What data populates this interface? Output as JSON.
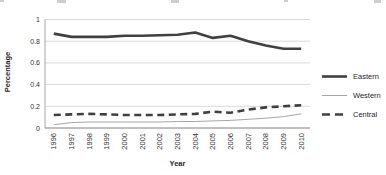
{
  "chart_data": {
    "type": "line",
    "title": "",
    "xlabel": "Year",
    "ylabel": "Percentage",
    "ylim": [
      0,
      1
    ],
    "yticks": [
      0,
      0.2,
      0.4,
      0.6,
      0.8,
      1
    ],
    "ytick_labels": [
      "0",
      "0.2",
      "0.4",
      "0.6",
      "0.8",
      "1"
    ],
    "grid": true,
    "legend_position": "right",
    "categories": [
      "1996",
      "1997",
      "1998",
      "1999",
      "2000",
      "2001",
      "2002",
      "2003",
      "2004",
      "2005",
      "2006",
      "2007",
      "2008",
      "2009",
      "2010"
    ],
    "series": [
      {
        "name": "Eastern",
        "color": "#404040",
        "width": 2.6,
        "dash": "",
        "values": [
          0.87,
          0.84,
          0.84,
          0.84,
          0.85,
          0.85,
          0.855,
          0.86,
          0.88,
          0.83,
          0.85,
          0.8,
          0.76,
          0.73,
          0.73
        ]
      },
      {
        "name": "Western",
        "color": "#a6a6a6",
        "width": 1,
        "dash": "",
        "values": [
          0.03,
          0.05,
          0.055,
          0.055,
          0.055,
          0.055,
          0.055,
          0.06,
          0.06,
          0.065,
          0.07,
          0.08,
          0.09,
          0.105,
          0.13
        ]
      },
      {
        "name": "Central",
        "color": "#404040",
        "width": 2.6,
        "dash": "7 4.5",
        "values": [
          0.12,
          0.125,
          0.13,
          0.125,
          0.12,
          0.12,
          0.12,
          0.125,
          0.13,
          0.15,
          0.14,
          0.17,
          0.19,
          0.2,
          0.21
        ]
      }
    ],
    "colors": {
      "gridline": "#d9d9d9",
      "y_axis_line": "#a6a6a6",
      "x_axis_line": "#808080",
      "tick_text": "#333333",
      "axis_title_text": "#1f1f1f"
    }
  }
}
